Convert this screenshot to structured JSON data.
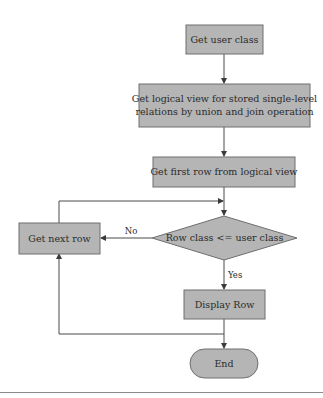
{
  "diagram": {
    "type": "flowchart",
    "colors": {
      "box_fill": "#b5b5b5",
      "box_stroke": "#6e6e6e",
      "line": "#4a4a4a",
      "text": "#2b2b2b"
    },
    "nodes": {
      "get_user_class": {
        "label": "Get user class"
      },
      "get_logical_view": {
        "line1": "Get logical view for stored single-level",
        "line2": "relations by union and join operation"
      },
      "get_first_row": {
        "label": "Get first row from logical view"
      },
      "row_class_check": {
        "label": "Row class <= user class"
      },
      "get_next_row": {
        "label": "Get next row"
      },
      "display_row": {
        "label": "Display Row"
      },
      "end": {
        "label": "End"
      }
    },
    "edges": {
      "no_label": "No",
      "yes_label": "Yes"
    }
  }
}
